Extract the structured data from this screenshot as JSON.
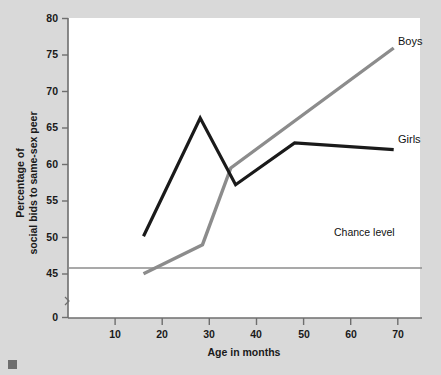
{
  "chart_data": {
    "type": "line",
    "title": "",
    "xlabel": "Age in months",
    "ylabel": "Percentage of\nsocial bids to same-sex peer",
    "ylabel_line1": "Percentage of",
    "ylabel_line2": "social bids to same-sex peer",
    "xlim": [
      0,
      75
    ],
    "ylim": [
      44,
      80
    ],
    "y_axis_break": true,
    "grid": false,
    "legend_position": "right-inline-labels",
    "xticks": [
      10,
      20,
      30,
      40,
      50,
      60,
      70
    ],
    "xtick_labels": [
      "10",
      "20",
      "30",
      "40",
      "50",
      "60",
      "70"
    ],
    "yticks": [
      0,
      45,
      50,
      55,
      60,
      65,
      70,
      75,
      80
    ],
    "ytick_labels": [
      "0",
      "45",
      "50",
      "55",
      "60",
      "65",
      "70",
      "75",
      "80"
    ],
    "series": [
      {
        "name": "Boys",
        "color": "#8c8c8c",
        "x": [
          16,
          28.5,
          34.5,
          69
        ],
        "values": [
          49.3,
          52.8,
          62.0,
          76.4
        ]
      },
      {
        "name": "Girls",
        "color": "#1a1a1a",
        "x": [
          16,
          28,
          35.5,
          48,
          69
        ],
        "values": [
          53.8,
          68.0,
          60.0,
          65.0,
          64.2
        ]
      }
    ],
    "reference_lines": [
      {
        "name": "Chance level",
        "label": "Chance level",
        "value": 50,
        "orientation": "horizontal",
        "color": "#8c8c8c"
      }
    ],
    "annotations": [
      {
        "text": "Boys",
        "x": 71,
        "y": 77.0
      },
      {
        "text": "Girls",
        "x": 71,
        "y": 64.4
      },
      {
        "text": "Chance level",
        "x": 54,
        "y": 51.3
      }
    ]
  },
  "axes": {
    "x_title": "Age in months",
    "y_title_line1": "Percentage of",
    "y_title_line2": "social bids to same-sex peer"
  },
  "labels": {
    "boys": "Boys",
    "girls": "Girls",
    "chance_level": "Chance level"
  },
  "ticks": {
    "y": [
      "80",
      "75",
      "70",
      "65",
      "60",
      "55",
      "50",
      "45",
      "0"
    ],
    "x": [
      "10",
      "20",
      "30",
      "40",
      "50",
      "60",
      "70"
    ]
  },
  "colors": {
    "boys_line": "#8c8c8c",
    "girls_line": "#1a1a1a",
    "chance_line": "#8c8c8c",
    "axis": "#6e6e6e",
    "plot_background": "#ffffff",
    "page_background": "#d9d9d9"
  }
}
